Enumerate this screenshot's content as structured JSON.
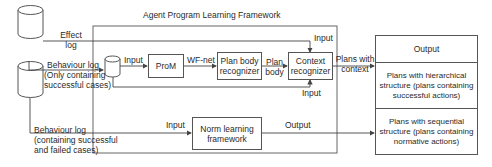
{
  "framework": {
    "title": "Agent Program Learning Framework"
  },
  "inputs": {
    "effect_log": [
      "Effect",
      "log"
    ],
    "behaviour_log_success": [
      "Behaviour log",
      "(Only containing",
      "successful cases)"
    ],
    "behaviour_log_all": [
      "Behaviour log",
      "(containing successful",
      "and failed cases)"
    ]
  },
  "nodes": {
    "prom": "ProM",
    "plan_body_recognizer": [
      "Plan body",
      "recognizer"
    ],
    "context_recognizer": [
      "Context",
      "recognizer"
    ],
    "norm_learning": [
      "Norm learning",
      "framework"
    ]
  },
  "edges": {
    "input_to_prom": "Input",
    "wf_net": "WF-net",
    "plan_body": [
      "Plan",
      "body"
    ],
    "context_input_top": "Input",
    "context_input_bottom": "Input",
    "plans_with_context": [
      "Plans with",
      "context"
    ],
    "norm_input": "Input",
    "norm_output": "Output"
  },
  "output_table": {
    "header": "Output",
    "rows": [
      [
        "Plans with hierarchical",
        "structure (plans containing",
        "successful actions)"
      ],
      [
        "Plans with sequential",
        "structure (plans containing",
        "normative actions)"
      ]
    ]
  }
}
